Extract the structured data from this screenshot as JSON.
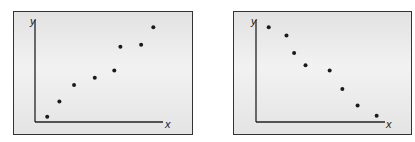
{
  "chart_data": [
    {
      "type": "scatter",
      "title": "",
      "xlabel": "x",
      "ylabel": "y",
      "trend": "positive correlation",
      "points": [
        {
          "x": 1,
          "y": 0.5
        },
        {
          "x": 2,
          "y": 2
        },
        {
          "x": 3.2,
          "y": 3.6
        },
        {
          "x": 4.9,
          "y": 4.3
        },
        {
          "x": 6.5,
          "y": 5
        },
        {
          "x": 7,
          "y": 7.3
        },
        {
          "x": 8.7,
          "y": 7.5
        },
        {
          "x": 9.7,
          "y": 9.2
        }
      ],
      "grid": false,
      "legend": false
    },
    {
      "type": "scatter",
      "title": "",
      "xlabel": "x",
      "ylabel": "y",
      "trend": "negative correlation",
      "points": [
        {
          "x": 1,
          "y": 9.2
        },
        {
          "x": 2.4,
          "y": 8.4
        },
        {
          "x": 3,
          "y": 6.7
        },
        {
          "x": 3.9,
          "y": 5.5
        },
        {
          "x": 5.8,
          "y": 5
        },
        {
          "x": 6.8,
          "y": 3.2
        },
        {
          "x": 8,
          "y": 1.6
        },
        {
          "x": 9.5,
          "y": 0.6
        }
      ],
      "grid": false,
      "legend": false
    }
  ],
  "panels": [
    {
      "xlabel": "x",
      "ylabel": "y"
    },
    {
      "xlabel": "x",
      "ylabel": "y"
    }
  ],
  "colors": {
    "axis": "#222222",
    "point": "#1a1a1a",
    "border": "#333333"
  }
}
